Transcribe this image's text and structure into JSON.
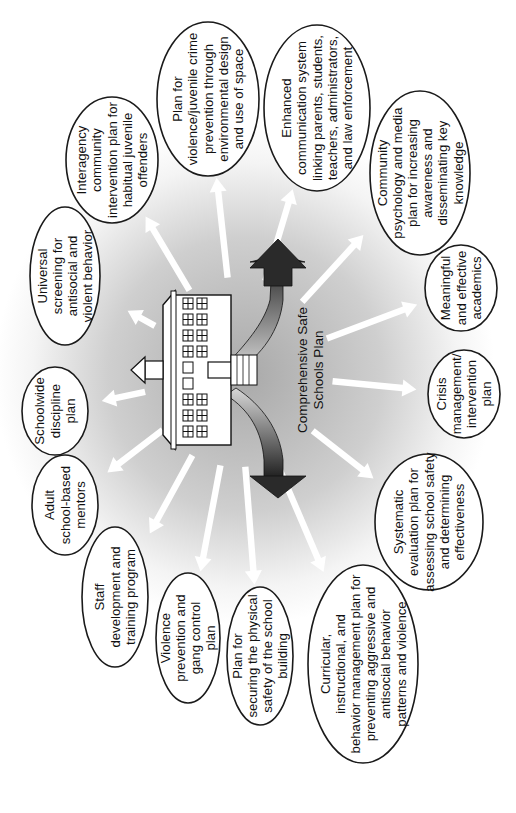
{
  "diagram": {
    "orientation": "rotated-90-ccw",
    "center": {
      "label_lines": [
        "Comprehensive Safe",
        "Schools Plan"
      ],
      "icon": "school-building-icon"
    },
    "colors": {
      "background_glow": "#bdbdbd",
      "ellipse_stroke": "#1a1a1a",
      "arrow_fill": "#ffffff",
      "double_arrow_dark": "#2a2a2a",
      "double_arrow_light": "#e0e0e0"
    },
    "nodes": [
      {
        "id": "cpted",
        "lines": [
          "Plan for",
          "violence/juvenile crime",
          "prevention through",
          "environmental design",
          "and use of space"
        ]
      },
      {
        "id": "communication",
        "lines": [
          "Enhanced",
          "communication system",
          "linking parents, students,",
          "teachers, administrators,",
          "and law enforcement"
        ]
      },
      {
        "id": "community-psychology",
        "lines": [
          "Community",
          "psychology and media",
          "plan for increasing",
          "awareness and",
          "disseminating key",
          "knowledge"
        ]
      },
      {
        "id": "academics",
        "lines": [
          "Meaningful",
          "and effective",
          "academics"
        ]
      },
      {
        "id": "crisis",
        "lines": [
          "Crisis",
          "management/",
          "intervention",
          "plan"
        ]
      },
      {
        "id": "evaluation",
        "lines": [
          "Systematic",
          "evaluation plan for",
          "assessing school safety",
          "and determining",
          "effectiveness"
        ]
      },
      {
        "id": "curricular",
        "lines": [
          "Curricular,",
          "instructional, and",
          "behavior management plan for",
          "preventing aggressive and",
          "antisocial behavior",
          "patterns and violence"
        ]
      },
      {
        "id": "physical-safety",
        "lines": [
          "Plan for",
          "securing the physical",
          "safety of the school",
          "building"
        ]
      },
      {
        "id": "gang-control",
        "lines": [
          "Violence",
          "prevention and",
          "gang control",
          "plan"
        ]
      },
      {
        "id": "staff-development",
        "lines": [
          "Staff",
          "development and",
          "training program"
        ]
      },
      {
        "id": "mentors",
        "lines": [
          "Adult",
          "school-based",
          "mentors"
        ]
      },
      {
        "id": "discipline",
        "lines": [
          "Schoolwide",
          "discipline",
          "plan"
        ]
      },
      {
        "id": "screening",
        "lines": [
          "Universal",
          "screening for",
          "antisocial and",
          "violent behavior"
        ]
      },
      {
        "id": "interagency",
        "lines": [
          "Interagency",
          "community",
          "intervention plan for",
          "habitual juvenile",
          "offenders"
        ]
      }
    ]
  }
}
